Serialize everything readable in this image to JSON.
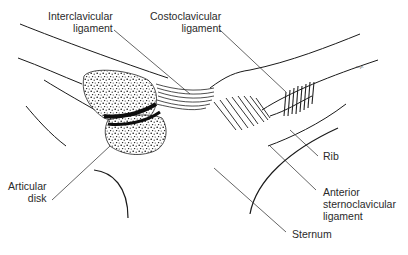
{
  "figure": {
    "labels": {
      "interclavicular": {
        "line1": "Interclavicular",
        "line2": "ligament"
      },
      "costoclavicular": {
        "line1": "Costoclavicular",
        "line2": "ligament"
      },
      "articular_disk": {
        "line1": "Articular",
        "line2": "disk"
      },
      "rib": "Rib",
      "anterior_sternoclavicular": {
        "line1": "Anterior",
        "line2": "sternoclavicular",
        "line3": "ligament"
      },
      "sternum": "Sternum"
    },
    "signature": "w.p.",
    "colors": {
      "ink": "#1a1a1a",
      "label_text": "#2a2a2a",
      "background": "#ffffff"
    }
  }
}
